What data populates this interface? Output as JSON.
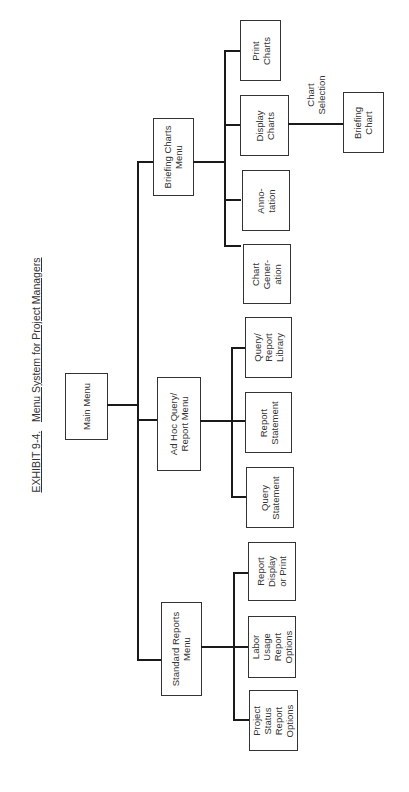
{
  "title": {
    "exhibit": "EXHIBIT 9-4.",
    "text": "Menu System for Project Managers"
  },
  "root": {
    "label": "Main Menu"
  },
  "menus": [
    {
      "label": "Briefing Charts\nMenu",
      "children": [
        {
          "label": "Print\nCharts"
        },
        {
          "label": "Display\nCharts"
        },
        {
          "label": "Anno-\ntation"
        },
        {
          "label": "Chart\nGener-\nation"
        }
      ]
    },
    {
      "label": "Ad Hoc Query/\nReport Menu",
      "children": [
        {
          "label": "Query/\nReport\nLibrary"
        },
        {
          "label": "Report\nStatement"
        },
        {
          "label": "Query\nStatement"
        }
      ]
    },
    {
      "label": "Standard Reports\nMenu",
      "children": [
        {
          "label": "Report\nDisplay\nor Print"
        },
        {
          "label": "Labor\nUsage\nReport\nOptions"
        },
        {
          "label": "Project\nStatus\nReport\nOptions"
        }
      ]
    }
  ],
  "display_charts_branch": {
    "edge_label": "Chart\nSelection",
    "target": {
      "label": "Briefing\nChart"
    }
  },
  "colors": {
    "line": "#1a1a1a",
    "box_border": "#333333",
    "text": "#333333",
    "background": "#ffffff"
  }
}
